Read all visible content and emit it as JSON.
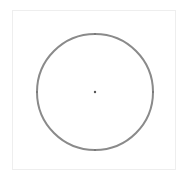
{
  "diagram": {
    "shape": "circle",
    "center": [
      95,
      92
    ],
    "radius": 58,
    "stroke_color": "#8a8a8a",
    "stroke_width": 2,
    "center_point_color": "#555555",
    "panel_border_color": "#eeeeee"
  }
}
